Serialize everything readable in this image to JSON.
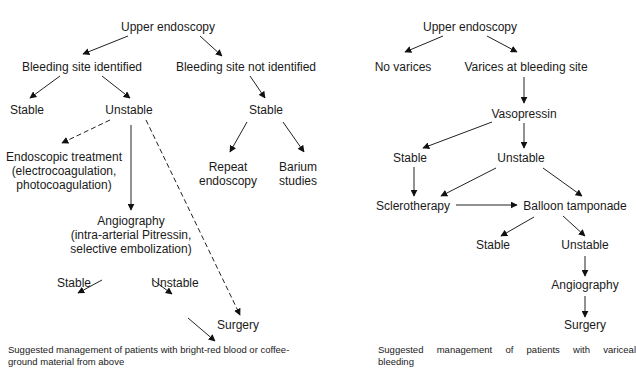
{
  "left_panel": {
    "nodes": {
      "root": "Upper endoscopy",
      "identified": "Bleeding site identified",
      "not_identified": "Bleeding site not identified",
      "stable1": "Stable",
      "unstable1": "Unstable",
      "stable2": "Stable",
      "endo_tx_1": "Endoscopic treatment",
      "endo_tx_2": "(electrocoagulation,",
      "endo_tx_3": "photocoagulation)",
      "repeat_1": "Repeat",
      "repeat_2": "endoscopy",
      "barium_1": "Barium",
      "barium_2": "studies",
      "angio_1": "Angiography",
      "angio_2": "(intra-arterial Pitressin,",
      "angio_3": "selective embolization)",
      "stable3": "Stable",
      "unstable3": "Unstable",
      "surgery": "Surgery"
    },
    "caption_1": "Suggested management of patients with bright-red blood or coffee-",
    "caption_2": "ground material from above"
  },
  "right_panel": {
    "nodes": {
      "root": "Upper endoscopy",
      "no_varices": "No varices",
      "varices": "Varices at bleeding site",
      "vasopressin": "Vasopressin",
      "stable1": "Stable",
      "unstable1": "Unstable",
      "sclerotherapy": "Sclerotherapy",
      "balloon": "Balloon tamponade",
      "stable2": "Stable",
      "unstable2": "Unstable",
      "angiography": "Angiography",
      "surgery": "Surgery"
    },
    "caption_1": "Suggested management of patients with variceal",
    "caption_2": "bleeding"
  }
}
